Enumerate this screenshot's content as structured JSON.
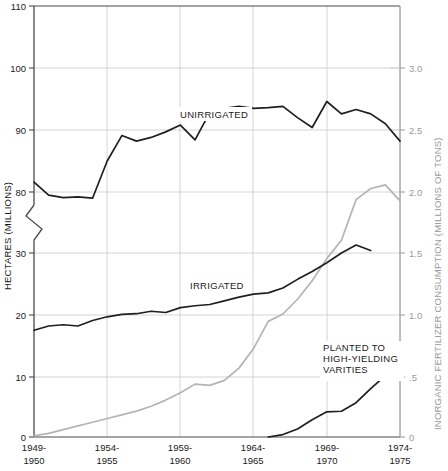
{
  "chart_data": {
    "type": "line",
    "title": "",
    "subtitle": "",
    "ylabel": "HECTARES (MILLIONS)",
    "ylabel_right": "INORGANIC FERTILIZER CONSUMPTION (MILLIONS OF TONS)",
    "xlabel": "",
    "grid": true,
    "legend_position": "inline-annotations",
    "x_tick_labels": [
      {
        "line1": "1949-",
        "line2": "1950"
      },
      {
        "line1": "1954-",
        "line2": "1955"
      },
      {
        "line1": "1959-",
        "line2": "1960"
      },
      {
        "line1": "1964-",
        "line2": "1965"
      },
      {
        "line1": "1969-",
        "line2": "1970"
      },
      {
        "line1": "1974-",
        "line2": "1975"
      }
    ],
    "y_tick_labels_left": [
      "110",
      "100",
      "90",
      "80",
      "30",
      "20",
      "10",
      "0"
    ],
    "y_tick_labels_right": [
      "3.0",
      "2.5",
      "2.0",
      "1.5",
      "1.0",
      ".5",
      "0"
    ],
    "ylim_left_upper": [
      78,
      110
    ],
    "ylim_left_lower": [
      0,
      32
    ],
    "y_axis_break": true,
    "ylim_right": [
      0,
      3.2
    ],
    "xlim": [
      "1949-1950",
      "1975-1976"
    ],
    "annotations": [
      {
        "text": "UNIRRIGATED",
        "series": "unirrigated"
      },
      {
        "text": "IRRIGATED",
        "series": "irrigated"
      },
      {
        "text": "PLANTED TO\nHIGH-YIELDING\nVARITIES",
        "line1": "PLANTED TO",
        "line2": "HIGH-YIELDING",
        "line3": "VARITIES",
        "series": "high_yielding"
      }
    ],
    "series": [
      {
        "name": "UNIRRIGATED",
        "color": "#1f1f1f",
        "axis": "left",
        "x": [
          1949,
          1950,
          1951,
          1952,
          1953,
          1954,
          1955,
          1956,
          1957,
          1958,
          1959,
          1960,
          1961,
          1962,
          1963,
          1964,
          1965,
          1966,
          1967,
          1968,
          1969,
          1970,
          1971,
          1972,
          1973,
          1974
        ],
        "values": [
          81.6,
          79.5,
          79.1,
          79.2,
          79.0,
          85.0,
          89.1,
          88.2,
          88.8,
          89.7,
          90.8,
          88.4,
          92.8,
          93.5,
          93.8,
          93.5,
          93.6,
          93.8,
          92.0,
          90.4,
          94.6,
          92.6,
          93.3,
          92.6,
          91.0,
          88.2
        ]
      },
      {
        "name": "IRRIGATED",
        "color": "#1f1f1f",
        "axis": "left",
        "x": [
          1949,
          1950,
          1951,
          1952,
          1953,
          1954,
          1955,
          1956,
          1957,
          1958,
          1959,
          1960,
          1961,
          1962,
          1963,
          1964,
          1965,
          1966,
          1967,
          1968,
          1969,
          1970,
          1971,
          1972
        ],
        "values": [
          17.4,
          18.1,
          18.3,
          18.1,
          19.0,
          19.6,
          20.0,
          20.1,
          20.5,
          20.3,
          21.1,
          21.4,
          21.6,
          22.2,
          22.8,
          23.3,
          23.5,
          24.3,
          25.7,
          27.0,
          28.4,
          30.0,
          31.3,
          30.4
        ]
      },
      {
        "name": "INORGANIC FERTILIZER CONSUMPTION",
        "color": "#b4b4b4",
        "axis": "right",
        "x": [
          1949,
          1950,
          1951,
          1952,
          1953,
          1954,
          1955,
          1956,
          1957,
          1958,
          1959,
          1960,
          1961,
          1962,
          1963,
          1964,
          1965,
          1966,
          1967,
          1968,
          1969,
          1970,
          1971,
          1972,
          1973,
          1974
        ],
        "values": [
          0.01,
          0.03,
          0.06,
          0.09,
          0.12,
          0.15,
          0.18,
          0.21,
          0.25,
          0.3,
          0.36,
          0.43,
          0.42,
          0.46,
          0.56,
          0.72,
          0.94,
          1.0,
          1.12,
          1.27,
          1.45,
          1.6,
          1.93,
          2.02,
          2.05,
          1.92
        ]
      },
      {
        "name": "PLANTED TO HIGH-YIELDING VARITIES",
        "color": "#1f1f1f",
        "axis": "left",
        "x": [
          1965,
          1966,
          1967,
          1968,
          1969,
          1970,
          1971,
          1972,
          1973
        ],
        "values": [
          0.0,
          0.4,
          1.3,
          2.8,
          4.1,
          4.2,
          5.6,
          7.9,
          10.0
        ]
      }
    ]
  }
}
